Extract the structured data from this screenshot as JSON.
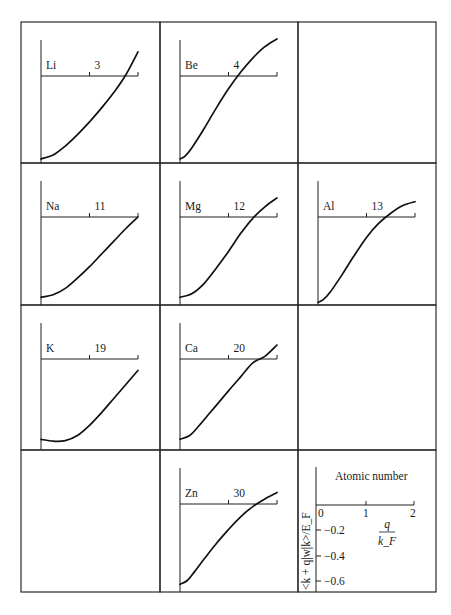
{
  "figure": {
    "key": {
      "title": "Atomic number",
      "ylabel": "<k + q|w|k>/E_F",
      "xlabel_num": "q",
      "xlabel_den": "k_F",
      "x_ticks": [
        "0",
        "1",
        "2"
      ],
      "y_ticks": [
        "−0.2",
        "−0.4",
        "−0.6"
      ]
    }
  },
  "chart_data": {
    "type": "line",
    "title": "",
    "xlabel": "q / k_F",
    "ylabel": "<k + q|w|k> / E_F",
    "xlim": [
      0,
      2
    ],
    "ylim": [
      -0.7,
      0.35
    ],
    "grid": false,
    "layout": "4x3 small multiples (empty cells at row1 col3, row3 col3, row4 col1; key at row4 col3)",
    "panels": [
      {
        "element": "Li",
        "atomic_number": "3",
        "row": 0,
        "col": 0,
        "x": [
          0,
          0.25,
          0.5,
          0.75,
          1.0,
          1.25,
          1.5,
          1.75,
          2.0
        ],
        "y": [
          -0.65,
          -0.62,
          -0.55,
          -0.46,
          -0.36,
          -0.25,
          -0.13,
          0.01,
          0.19
        ]
      },
      {
        "element": "Be",
        "atomic_number": "4",
        "row": 0,
        "col": 1,
        "x": [
          0,
          0.1,
          0.25,
          0.5,
          0.75,
          1.0,
          1.25,
          1.5,
          1.75,
          2.0
        ],
        "y": [
          -0.65,
          -0.63,
          -0.56,
          -0.41,
          -0.25,
          -0.1,
          0.03,
          0.14,
          0.23,
          0.29
        ]
      },
      {
        "element": "Na",
        "atomic_number": "11",
        "row": 1,
        "col": 0,
        "x": [
          0,
          0.25,
          0.5,
          0.75,
          1.0,
          1.25,
          1.5,
          1.75,
          2.0
        ],
        "y": [
          -0.63,
          -0.61,
          -0.56,
          -0.48,
          -0.39,
          -0.29,
          -0.19,
          -0.09,
          0.0
        ]
      },
      {
        "element": "Mg",
        "atomic_number": "12",
        "row": 1,
        "col": 1,
        "x": [
          0,
          0.25,
          0.5,
          0.75,
          1.0,
          1.25,
          1.5,
          1.75,
          2.0
        ],
        "y": [
          -0.63,
          -0.6,
          -0.52,
          -0.4,
          -0.27,
          -0.13,
          -0.01,
          0.08,
          0.15
        ]
      },
      {
        "element": "Al",
        "atomic_number": "13",
        "row": 1,
        "col": 2,
        "x": [
          0,
          0.1,
          0.25,
          0.5,
          0.75,
          1.0,
          1.25,
          1.5,
          1.75,
          2.0
        ],
        "y": [
          -0.67,
          -0.65,
          -0.59,
          -0.45,
          -0.3,
          -0.16,
          -0.05,
          0.03,
          0.09,
          0.12
        ]
      },
      {
        "element": "K",
        "atomic_number": "19",
        "row": 2,
        "col": 0,
        "x": [
          0,
          0.25,
          0.5,
          0.75,
          1.0,
          1.25,
          1.5,
          1.75,
          2.0
        ],
        "y": [
          -0.63,
          -0.645,
          -0.64,
          -0.6,
          -0.52,
          -0.42,
          -0.31,
          -0.2,
          -0.09
        ]
      },
      {
        "element": "Ca",
        "atomic_number": "20",
        "row": 2,
        "col": 1,
        "x": [
          0,
          0.2,
          0.4,
          0.6,
          0.8,
          1.0,
          1.25,
          1.5,
          1.75,
          2.0
        ],
        "y": [
          -0.63,
          -0.6,
          -0.52,
          -0.43,
          -0.34,
          -0.25,
          -0.14,
          -0.03,
          0.02,
          0.11
        ]
      },
      {
        "element": "Zn",
        "atomic_number": "30",
        "row": 3,
        "col": 1,
        "x": [
          0,
          0.15,
          0.3,
          0.5,
          0.75,
          1.0,
          1.25,
          1.5,
          1.75,
          2.0
        ],
        "y": [
          -0.63,
          -0.6,
          -0.53,
          -0.43,
          -0.31,
          -0.2,
          -0.1,
          -0.02,
          0.04,
          0.09
        ]
      }
    ]
  }
}
